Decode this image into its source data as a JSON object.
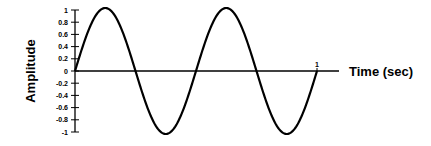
{
  "chart_data": {
    "type": "line",
    "title": "",
    "xlabel": "Time (sec)",
    "ylabel": "Amplitude",
    "xlim": [
      0,
      1
    ],
    "ylim": [
      -1,
      1
    ],
    "x_ticks": [
      "1"
    ],
    "y_ticks": [
      "1",
      "0.8",
      "0.6",
      "0.4",
      "0.2",
      "0",
      "-0.2",
      "-0.4",
      "-0.6",
      "-0.8",
      "-1"
    ],
    "grid": false,
    "legend": null,
    "series": [
      {
        "name": "sine wave",
        "function": "sin(2*pi*2*t)",
        "frequency_hz": 2,
        "amplitude": 1,
        "x": [
          0,
          0.125,
          0.25,
          0.375,
          0.5,
          0.625,
          0.75,
          0.875,
          1
        ],
        "values": [
          0,
          1,
          0,
          -1,
          0,
          1,
          0,
          -1,
          0
        ]
      }
    ],
    "color": "#000000"
  }
}
